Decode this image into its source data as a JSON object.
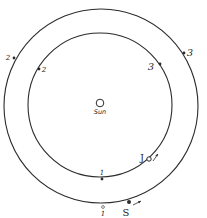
{
  "diagram": {
    "sun": {
      "label": "Sun",
      "cx": 100,
      "cy": 103,
      "r": 4
    },
    "orbits": [
      {
        "name": "inner-orbit",
        "body": "J",
        "cx": 100,
        "cy": 105,
        "r": 72
      },
      {
        "name": "outer-orbit",
        "body": "S",
        "cx": 101,
        "cy": 106,
        "r": 97
      }
    ],
    "inner_positions": [
      {
        "label": "1",
        "x": 102,
        "y": 179,
        "lx": 102,
        "ly": 173
      },
      {
        "label": "2",
        "x": 39,
        "y": 68,
        "lx": 44,
        "ly": 72
      },
      {
        "label": "3",
        "x": 160,
        "y": 64,
        "lx": 150,
        "ly": 70
      }
    ],
    "outer_positions": [
      {
        "label": "1",
        "x": 103,
        "y": 207,
        "lx": 103,
        "ly": 215
      },
      {
        "label": "2",
        "x": 14,
        "y": 58,
        "lx": 8,
        "ly": 60
      },
      {
        "label": "3",
        "x": 184,
        "y": 53,
        "lx": 189,
        "ly": 55
      }
    ],
    "planets": [
      {
        "label": "J",
        "x": 149,
        "y": 159,
        "lx": 140,
        "ly": 158,
        "arrow": "↗"
      },
      {
        "label": "S",
        "x": 129,
        "y": 202,
        "lx": 125,
        "ly": 216,
        "arrow": "→"
      }
    ],
    "colors": {
      "line": "#2b2b2b",
      "background": "#ffffff"
    }
  }
}
